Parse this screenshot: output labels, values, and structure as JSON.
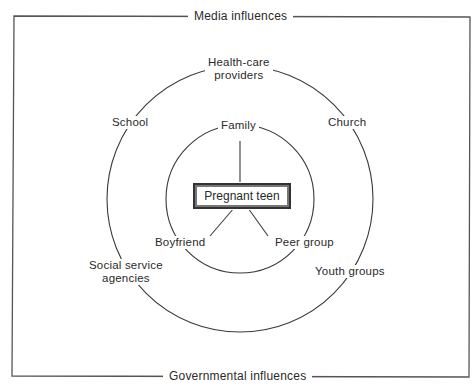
{
  "diagram": {
    "frame": {
      "top_label": "Media influences",
      "bottom_label": "Governmental influences"
    },
    "outer_ring": {
      "labels": [
        "Health-care providers",
        "Church",
        "Youth groups",
        "Social service agencies",
        "School"
      ],
      "health_care_line1": "Health-care",
      "health_care_line2": "providers",
      "church": "Church",
      "youth_groups": "Youth groups",
      "social_service_line1": "Social service",
      "social_service_line2": "agencies",
      "school": "School"
    },
    "inner_ring": {
      "family": "Family",
      "boyfriend": "Boyfriend",
      "peer_group": "Peer group"
    },
    "center": {
      "label": "Pregnant teen"
    },
    "colors": {
      "line": "#3a3a3a",
      "background": "#ffffff"
    }
  }
}
